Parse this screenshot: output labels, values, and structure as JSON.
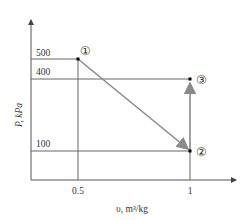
{
  "diagram": {
    "type": "P-v process diagram",
    "y_axis": {
      "label": "P, kPa",
      "ticks": [
        "500",
        "400",
        "100"
      ]
    },
    "x_axis": {
      "label": "υ, m³/kg",
      "ticks": [
        "0.5",
        "1"
      ]
    },
    "states": [
      {
        "id": "1",
        "symbol": "①",
        "P": 500,
        "v": 0.5
      },
      {
        "id": "2",
        "symbol": "②",
        "P": 100,
        "v": 1
      },
      {
        "id": "3",
        "symbol": "③",
        "P": 400,
        "v": 1
      }
    ],
    "processes": [
      {
        "from": "1",
        "to": "2",
        "type": "linear"
      },
      {
        "from": "2",
        "to": "3",
        "type": "constant volume"
      }
    ],
    "colors": {
      "axes": "#555555",
      "guides": "#666666",
      "process": "#8a8a8a",
      "points": "#000000"
    }
  }
}
